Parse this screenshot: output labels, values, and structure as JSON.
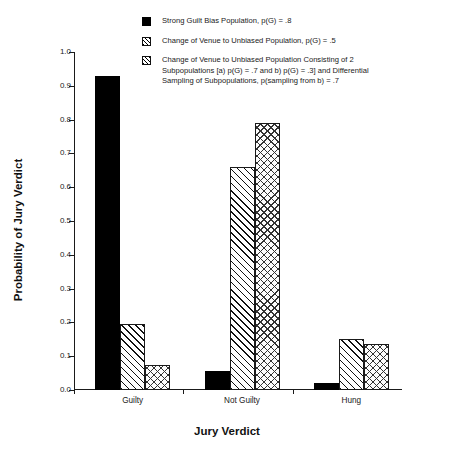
{
  "chart_data": {
    "type": "bar",
    "title": "",
    "xlabel": "Jury Verdict",
    "ylabel": "Probability of Jury Verdict",
    "categories": [
      "Guilty",
      "Not Guilty",
      "Hung"
    ],
    "ylim": [
      0.0,
      1.0
    ],
    "ytick_labels": [
      "0.0",
      "0.1",
      "0.2",
      "0.3",
      "0.4",
      "0.5",
      "0.6",
      "0.7",
      "0.8",
      "0.9",
      "1.0"
    ],
    "ytick_values": [
      0.0,
      0.1,
      0.2,
      0.3,
      0.4,
      0.5,
      0.6,
      0.7,
      0.8,
      0.9,
      1.0
    ],
    "grid": false,
    "legend_position": "top",
    "series": [
      {
        "name": "Strong Guilt Bias Population, p(G) = .8",
        "pattern": "solid",
        "values": [
          0.93,
          0.055,
          0.02
        ]
      },
      {
        "name": "Change of Venue to Unbiased Population, p(G) = .5",
        "pattern": "hatch",
        "values": [
          0.195,
          0.66,
          0.15
        ]
      },
      {
        "name": "Change of Venue to Unbiased Population Consisting of 2 Subpopulations [a) p(G) = .7 and b) p(G) = .3] and Differential Sampling of Subpopulations, p(sampling from b) = .7",
        "pattern": "cross",
        "values": [
          0.075,
          0.79,
          0.137
        ]
      }
    ]
  },
  "legend": {
    "entries": [
      {
        "swatch": "solid",
        "label": "Strong Guilt Bias Population, p(G) = .8"
      },
      {
        "swatch": "hatch",
        "label": "Change of Venue to Unbiased Population, p(G) = .5"
      },
      {
        "swatch": "cross",
        "label": "Change of Venue to Unbiased Population Consisting of 2\nSubpopulations [a) p(G) = .7 and b) p(G) = .3] and Differential\nSampling of Subpopulations, p(sampling from b) = .7"
      }
    ]
  }
}
